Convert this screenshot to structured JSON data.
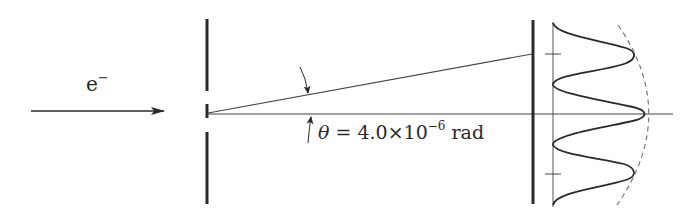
{
  "diagram": {
    "particle_label": "e",
    "particle_charge": "−",
    "angle_label": {
      "symbol": "θ",
      "equals": " = 4.0×10",
      "exponent": "−6",
      "unit": " rad"
    },
    "angle_value_rad": "4.0×10⁻⁶",
    "colors": {
      "ink": "#2a2a2a",
      "thin_line": "#555555",
      "dashed_envelope": "#777777",
      "background": "#ffffff"
    },
    "elements": [
      "incident electron beam arrow",
      "double-slit barrier",
      "ray to first maximum",
      "central axis",
      "detection screen",
      "intensity distribution curve",
      "single-slit envelope (dashed)",
      "maxima tick marks"
    ]
  }
}
